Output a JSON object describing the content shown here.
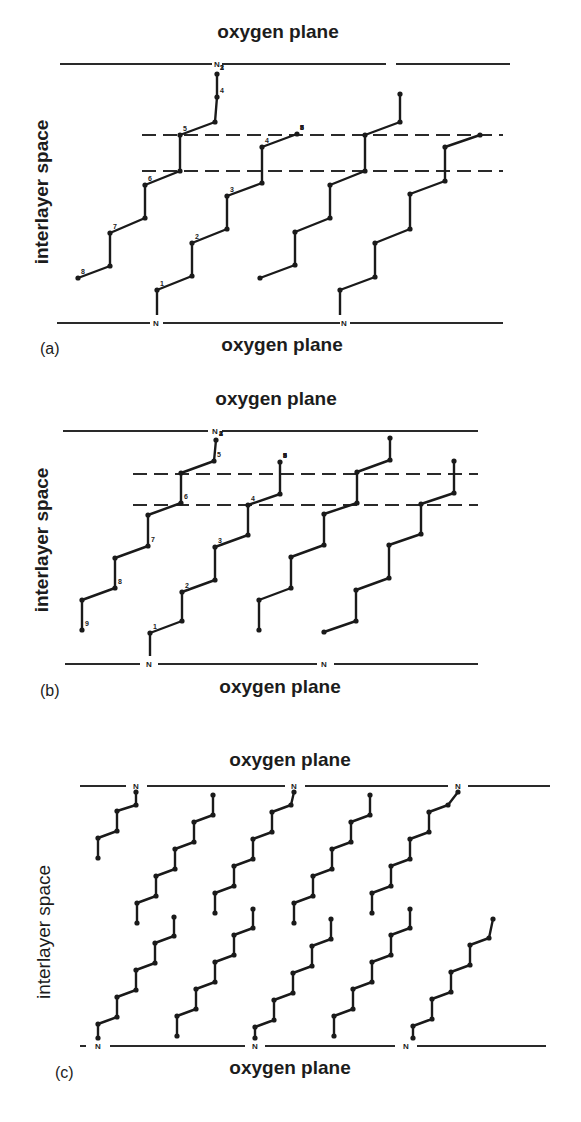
{
  "figure": {
    "panels": [
      {
        "id": "a",
        "panel_label": "(a)",
        "top_plane_label": "oxygen plane",
        "bottom_plane_label": "oxygen plane",
        "side_label": "interlayer space",
        "n_marker": "N",
        "top_plane_y": 64,
        "bottom_plane_y": 323,
        "top_plane_label_pos": [
          278,
          38
        ],
        "bottom_plane_label_pos": [
          282,
          351
        ],
        "panel_label_pos": [
          40,
          354
        ],
        "side_label_pos": [
          48,
          192
        ],
        "top_plane_segments": [
          [
            60,
            212
          ],
          [
            222,
            386
          ],
          [
            396,
            510
          ]
        ],
        "bottom_plane_segments": [
          [
            57,
            150
          ],
          [
            163,
            340
          ],
          [
            350,
            503
          ]
        ],
        "top_n": [
          217
        ],
        "bottom_n": [
          156,
          344
        ],
        "dashed_lines": [
          {
            "y": 135,
            "x1": 142,
            "x2": 503
          },
          {
            "y": 171,
            "x1": 142,
            "x2": 503
          }
        ],
        "chains": [
          {
            "points": [
              [
                78,
                278
              ],
              [
                110,
                266
              ],
              [
                110,
                233
              ],
              [
                145,
                218
              ],
              [
                145,
                185
              ],
              [
                180,
                171
              ],
              [
                180,
                135
              ],
              [
                215,
                122
              ],
              [
                217,
                97
              ],
              [
                217,
                74
              ]
            ],
            "labels": [
              "8",
              "7",
              "6",
              "5",
              "4",
              "3",
              "2",
              "1"
            ]
          },
          {
            "points": [
              [
                157,
                290
              ],
              [
                192,
                276
              ],
              [
                192,
                243
              ],
              [
                227,
                229
              ],
              [
                227,
                196
              ],
              [
                262,
                183
              ],
              [
                262,
                147
              ],
              [
                297,
                134
              ]
            ],
            "labels": [
              "1",
              "2",
              "3",
              "4",
              "5",
              "6",
              "7",
              "8"
            ]
          },
          {
            "points": [
              [
                260,
                278
              ],
              [
                295,
                265
              ],
              [
                295,
                232
              ],
              [
                330,
                218
              ],
              [
                330,
                185
              ],
              [
                365,
                171
              ],
              [
                365,
                135
              ],
              [
                400,
                122
              ],
              [
                400,
                94
              ]
            ]
          },
          {
            "points": [
              [
                340,
                290
              ],
              [
                375,
                277
              ],
              [
                375,
                243
              ],
              [
                410,
                229
              ],
              [
                410,
                194
              ],
              [
                445,
                181
              ],
              [
                445,
                147
              ],
              [
                480,
                135
              ]
            ]
          }
        ],
        "chain_extras": [
          {
            "from": [
              157,
              290
            ],
            "to": [
              157,
              315
            ]
          },
          {
            "from": [
              340,
              290
            ],
            "to": [
              340,
              315
            ]
          }
        ]
      },
      {
        "id": "b",
        "panel_label": "(b)",
        "top_plane_label": "oxygen plane",
        "bottom_plane_label": "oxygen plane",
        "side_label": "interlayer space",
        "n_marker": "N",
        "top_plane_y": 431,
        "bottom_plane_y": 664,
        "top_plane_label_pos": [
          276,
          405
        ],
        "bottom_plane_label_pos": [
          280,
          693
        ],
        "panel_label_pos": [
          40,
          696
        ],
        "side_label_pos": [
          48,
          540
        ],
        "top_plane_segments": [
          [
            63,
            208
          ],
          [
            222,
            478
          ]
        ],
        "bottom_plane_segments": [
          [
            65,
            140
          ],
          [
            158,
            317
          ],
          [
            334,
            478
          ]
        ],
        "top_n": [
          215
        ],
        "bottom_n": [
          149,
          324
        ],
        "dashed_lines": [
          {
            "y": 474,
            "x1": 133,
            "x2": 478
          },
          {
            "y": 505,
            "x1": 133,
            "x2": 478
          }
        ],
        "chains": [
          {
            "points": [
              [
                82,
                630
              ],
              [
                82,
                600
              ],
              [
                115,
                588
              ],
              [
                115,
                558
              ],
              [
                148,
                546
              ],
              [
                148,
                515
              ],
              [
                181,
                503
              ],
              [
                181,
                473
              ],
              [
                214,
                461
              ],
              [
                216,
                440
              ]
            ],
            "labels": [
              "9",
              "8",
              "7",
              "6",
              "5",
              "4",
              "3",
              "2",
              "1"
            ]
          },
          {
            "points": [
              [
                150,
                633
              ],
              [
                182,
                621
              ],
              [
                182,
                592
              ],
              [
                215,
                580
              ],
              [
                215,
                547
              ],
              [
                248,
                535
              ],
              [
                248,
                505
              ],
              [
                280,
                494
              ],
              [
                280,
                462
              ]
            ],
            "labels": [
              "1",
              "2",
              "3",
              "4",
              "5",
              "6",
              "7",
              "8",
              "9"
            ]
          },
          {
            "points": [
              [
                259,
                630
              ],
              [
                259,
                600
              ],
              [
                291,
                588
              ],
              [
                291,
                557
              ],
              [
                324,
                545
              ],
              [
                324,
                514
              ],
              [
                357,
                503
              ],
              [
                357,
                472
              ],
              [
                390,
                460
              ],
              [
                390,
                438
              ]
            ]
          },
          {
            "points": [
              [
                324,
                632
              ],
              [
                356,
                621
              ],
              [
                356,
                590
              ],
              [
                389,
                578
              ],
              [
                389,
                545
              ],
              [
                421,
                534
              ],
              [
                421,
                504
              ],
              [
                454,
                493
              ],
              [
                454,
                461
              ]
            ]
          }
        ],
        "chain_extras": [
          {
            "from": [
              150,
              633
            ],
            "to": [
              150,
              656
            ]
          }
        ]
      },
      {
        "id": "c",
        "panel_label": "(c)",
        "top_plane_label": "oxygen plane",
        "bottom_plane_label": "oxygen plane",
        "side_label": "interlayer space",
        "n_marker": "N",
        "top_plane_y": 786,
        "bottom_plane_y": 1046,
        "top_plane_label_pos": [
          290,
          766
        ],
        "bottom_plane_label_pos": [
          290,
          1074
        ],
        "panel_label_pos": [
          55,
          1078
        ],
        "side_label_pos": [
          50,
          932
        ],
        "top_plane_segments": [
          [
            80,
            126
          ],
          [
            147,
            285
          ],
          [
            305,
            448
          ],
          [
            468,
            550
          ]
        ],
        "bottom_plane_segments": [
          [
            80,
            86
          ],
          [
            110,
            245
          ],
          [
            265,
            395
          ],
          [
            417,
            546
          ]
        ],
        "top_n": [
          136,
          294,
          458
        ],
        "bottom_n": [
          98,
          255,
          406
        ],
        "dashed_lines": [],
        "chains": [
          {
            "points": [
              [
                98,
                858
              ],
              [
                98,
                838
              ],
              [
                117,
                831
              ],
              [
                117,
                811
              ],
              [
                136,
                805
              ],
              [
                136,
                792
              ]
            ]
          },
          {
            "points": [
              [
                137,
                923
              ],
              [
                137,
                903
              ],
              [
                156,
                896
              ],
              [
                156,
                876
              ],
              [
                175,
                869
              ],
              [
                175,
                849
              ],
              [
                194,
                842
              ],
              [
                194,
                822
              ],
              [
                213,
                815
              ],
              [
                213,
                795
              ]
            ]
          },
          {
            "points": [
              [
                215,
                913
              ],
              [
                215,
                893
              ],
              [
                234,
                886
              ],
              [
                234,
                866
              ],
              [
                253,
                859
              ],
              [
                253,
                839
              ],
              [
                272,
                832
              ],
              [
                272,
                812
              ],
              [
                291,
                805
              ],
              [
                294,
                792
              ]
            ]
          },
          {
            "points": [
              [
                294,
                923
              ],
              [
                294,
                903
              ],
              [
                313,
                896
              ],
              [
                313,
                876
              ],
              [
                332,
                869
              ],
              [
                332,
                849
              ],
              [
                351,
                842
              ],
              [
                351,
                822
              ],
              [
                370,
                815
              ],
              [
                370,
                795
              ]
            ]
          },
          {
            "points": [
              [
                372,
                913
              ],
              [
                372,
                893
              ],
              [
                391,
                886
              ],
              [
                391,
                866
              ],
              [
                410,
                859
              ],
              [
                410,
                839
              ],
              [
                429,
                832
              ],
              [
                429,
                812
              ],
              [
                448,
                805
              ],
              [
                458,
                792
              ]
            ]
          },
          {
            "points": [
              [
                98,
                1038
              ],
              [
                98,
                1024
              ],
              [
                117,
                1017
              ],
              [
                117,
                997
              ],
              [
                136,
                990
              ],
              [
                136,
                970
              ],
              [
                155,
                963
              ],
              [
                155,
                943
              ],
              [
                174,
                936
              ],
              [
                174,
                917
              ]
            ]
          },
          {
            "points": [
              [
                177,
                1036
              ],
              [
                177,
                1016
              ],
              [
                196,
                1009
              ],
              [
                196,
                989
              ],
              [
                215,
                982
              ],
              [
                215,
                962
              ],
              [
                234,
                955
              ],
              [
                234,
                935
              ],
              [
                253,
                928
              ],
              [
                253,
                909
              ]
            ]
          },
          {
            "points": [
              [
                255,
                1038
              ],
              [
                255,
                1027
              ],
              [
                274,
                1020
              ],
              [
                274,
                1000
              ],
              [
                293,
                993
              ],
              [
                293,
                973
              ],
              [
                312,
                966
              ],
              [
                312,
                946
              ],
              [
                331,
                939
              ],
              [
                331,
                919
              ]
            ]
          },
          {
            "points": [
              [
                334,
                1036
              ],
              [
                334,
                1016
              ],
              [
                353,
                1009
              ],
              [
                353,
                989
              ],
              [
                372,
                982
              ],
              [
                372,
                962
              ],
              [
                391,
                955
              ],
              [
                391,
                935
              ],
              [
                410,
                928
              ],
              [
                410,
                909
              ]
            ]
          },
          {
            "points": [
              [
                413,
                1038
              ],
              [
                413,
                1026
              ],
              [
                432,
                1019
              ],
              [
                432,
                999
              ],
              [
                451,
                992
              ],
              [
                451,
                972
              ],
              [
                470,
                965
              ],
              [
                470,
                945
              ],
              [
                489,
                938
              ],
              [
                493,
                919
              ]
            ]
          }
        ],
        "chain_extras": []
      }
    ]
  }
}
